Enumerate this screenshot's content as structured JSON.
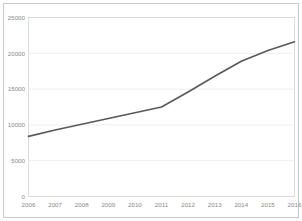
{
  "figure": {
    "background_color": "#ffffff",
    "frame_color": "#c9c9c9"
  },
  "chart_data": {
    "type": "line",
    "title": "",
    "subtitle": "",
    "xlabel": "",
    "ylabel": "",
    "categories": [
      "2006",
      "2007",
      "2008",
      "2009",
      "2010",
      "2011",
      "2012",
      "2013",
      "2014",
      "2015",
      "2016"
    ],
    "x": [
      2006,
      2007,
      2008,
      2009,
      2010,
      2011,
      2012,
      2013,
      2014,
      2015,
      2016
    ],
    "series": [
      {
        "name": "",
        "color": "#595959",
        "values": [
          8400,
          9300,
          10100,
          10900,
          11700,
          12500,
          14600,
          16800,
          18900,
          20400,
          21600
        ]
      }
    ],
    "ylim": [
      0,
      25000
    ],
    "yticks": [
      0,
      5000,
      10000,
      15000,
      20000,
      25000
    ],
    "ytick_labels": [
      "0",
      "5000",
      "10000",
      "15000",
      "20000",
      "25000"
    ],
    "xtick_labels": [
      "2006",
      "2007",
      "2008",
      "2009",
      "2010",
      "2011",
      "2012",
      "2013",
      "2014",
      "2015",
      "2016"
    ],
    "grid": true,
    "grid_axis": "y",
    "grid_color": "#e8e8e8",
    "legend": false,
    "legend_position": "none",
    "markers": false,
    "tick_label_color": "#8a8a8a",
    "plot_border_color": "#d5d5d5"
  }
}
